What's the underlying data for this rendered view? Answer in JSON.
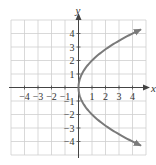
{
  "chart_data": {
    "type": "line",
    "title": "",
    "xlabel": "x",
    "ylabel": "y",
    "xlim": [
      -5,
      5
    ],
    "ylim": [
      -5,
      5
    ],
    "grid": true,
    "x_ticks": [
      -4,
      -3,
      -2,
      -1,
      1,
      2,
      3,
      4
    ],
    "y_ticks": [
      -4,
      -3,
      -2,
      -1,
      1,
      2,
      3,
      4
    ],
    "x_tick_labels": [
      "−4",
      "−3",
      "−2",
      "−1",
      "1",
      "2",
      "3",
      "4"
    ],
    "y_tick_labels": [
      "−4",
      "−3",
      "−2",
      "−1",
      "1",
      "2",
      "3",
      "4"
    ],
    "series": [
      {
        "name": "x = y^2/4",
        "equation": "x = y^2 / 4",
        "y_range": [
          -4.3,
          4.3
        ],
        "arrows": "both-ends",
        "color": "#7a7a7a",
        "points": [
          {
            "x": 4.62,
            "y": -4.3
          },
          {
            "x": 4.0,
            "y": -4
          },
          {
            "x": 2.25,
            "y": -3
          },
          {
            "x": 1.0,
            "y": -2
          },
          {
            "x": 0.25,
            "y": -1
          },
          {
            "x": 0,
            "y": 0
          },
          {
            "x": 0.25,
            "y": 1
          },
          {
            "x": 1.0,
            "y": 2
          },
          {
            "x": 2.25,
            "y": 3
          },
          {
            "x": 4.0,
            "y": 4
          },
          {
            "x": 4.62,
            "y": 4.3
          }
        ]
      }
    ],
    "colors": {
      "grid": "#cfcfcf",
      "axis": "#444444",
      "curve": "#7a7a7a"
    }
  }
}
